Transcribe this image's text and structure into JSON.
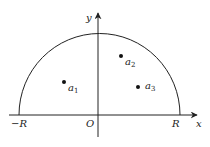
{
  "diagram": {
    "type": "semicircle-contour",
    "axes": {
      "x_label": "x",
      "y_label": "y",
      "origin_label": "O",
      "neg_radius_label": "−R",
      "pos_radius_label": "R"
    },
    "points": [
      {
        "name": "a",
        "sub": "1"
      },
      {
        "name": "a",
        "sub": "2"
      },
      {
        "name": "a",
        "sub": "3"
      }
    ],
    "colors": {
      "stroke": "#222222",
      "background": "#ffffff"
    }
  }
}
